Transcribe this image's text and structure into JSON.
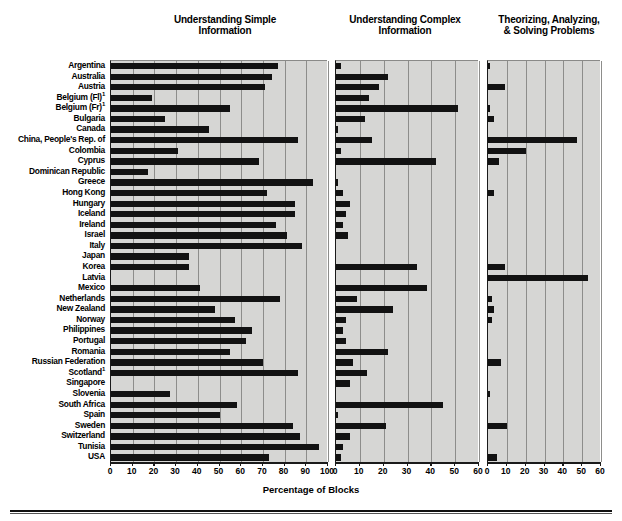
{
  "figure": {
    "x_caption": "Percentage of Blocks",
    "panels": [
      {
        "title": "Understanding Simple\nInformation",
        "xmax": 100,
        "xstep": 10
      },
      {
        "title": "Understanding Complex\nInformation",
        "xmax": 60,
        "xstep": 10
      },
      {
        "title": "Theorizing, Analyzing,\n& Solving Problems",
        "xmax": 60,
        "xstep": 10
      }
    ]
  },
  "chart_data": {
    "type": "bar",
    "title": "",
    "orientation": "horizontal",
    "xlabel": "Percentage of Blocks",
    "ylabel": "",
    "grid": true,
    "legend": "none",
    "panels": [
      {
        "name": "Understanding Simple Information",
        "xlim": [
          0,
          100
        ],
        "xticks": [
          0,
          10,
          20,
          30,
          40,
          50,
          60,
          70,
          80,
          90,
          100
        ]
      },
      {
        "name": "Understanding Complex Information",
        "xlim": [
          0,
          60
        ],
        "xticks": [
          0,
          10,
          20,
          30,
          40,
          50,
          60
        ]
      },
      {
        "name": "Theorizing, Analyzing, & Solving Problems",
        "xlim": [
          0,
          60
        ],
        "xticks": [
          0,
          10,
          20,
          30,
          40,
          50,
          60
        ]
      }
    ],
    "categories": [
      "Argentina",
      "Australia",
      "Austria",
      "Belgium (Fl)¹",
      "Belgium (Fr)¹",
      "Bulgaria",
      "Canada",
      "China, People's Rep. of",
      "Colombia",
      "Cyprus",
      "Dominican Republic",
      "Greece",
      "Hong Kong",
      "Hungary",
      "Iceland",
      "Ireland",
      "Israel",
      "Italy",
      "Japan",
      "Korea",
      "Latvia",
      "Mexico",
      "Netherlands",
      "New Zealand",
      "Norway",
      "Philippines",
      "Portugal",
      "Romania",
      "Russian Federation",
      "Scotland¹",
      "Singapore",
      "Slovenia",
      "South Africa",
      "Spain",
      "Sweden",
      "Switzerland",
      "Tunisia",
      "USA"
    ],
    "series": [
      {
        "name": "Understanding Simple Information",
        "panel": 0,
        "values": [
          77,
          74,
          71,
          19,
          55,
          25,
          45,
          86,
          31,
          68,
          17,
          93,
          72,
          85,
          85,
          76,
          81,
          88,
          36,
          36,
          0,
          41,
          78,
          48,
          57,
          65,
          62,
          55,
          70,
          86,
          0,
          27,
          58,
          50,
          84,
          87,
          96,
          73
        ]
      },
      {
        "name": "Understanding Complex Information",
        "panel": 1,
        "values": [
          2,
          22,
          18,
          14,
          51,
          12,
          1,
          15,
          2,
          42,
          0,
          1,
          3,
          6,
          4,
          3,
          5,
          0,
          0,
          34,
          0,
          38,
          9,
          24,
          4,
          3,
          4,
          22,
          7,
          13,
          6,
          0,
          45,
          1,
          21,
          6,
          3,
          2
        ]
      },
      {
        "name": "Theorizing, Analyzing, & Solving Problems",
        "panel": 2,
        "values": [
          1,
          0,
          9,
          0,
          1,
          3,
          0,
          47,
          20,
          6,
          0,
          0,
          3,
          0,
          0,
          0,
          0,
          0,
          0,
          9,
          53,
          0,
          2,
          3,
          2,
          0,
          0,
          0,
          7,
          0,
          0,
          1,
          0,
          0,
          10,
          0,
          0,
          5
        ]
      }
    ]
  }
}
